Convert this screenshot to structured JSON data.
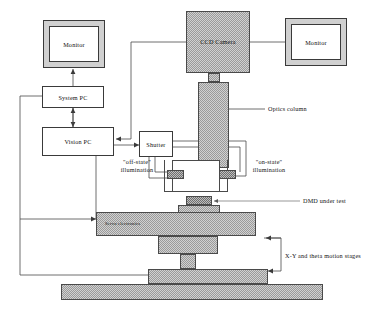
{
  "diagram": {
    "colors": {
      "hatch_fill": "#9a9a9a",
      "hatch_dark": "#6f6f6f",
      "monitor_bezel": "#d0d0d0",
      "line": "#4a4a4a",
      "box_fill": "#ffffff",
      "text": "#111111"
    },
    "nodes": {
      "monitor_left": "Monitor",
      "monitor_right": "Monitor",
      "ccd_camera": "CCD\nCamera",
      "system_pc": "System PC",
      "vision_pc": "Vision PC",
      "shutter": "Shutter",
      "servo_electronics": "Servo electronics"
    },
    "labels": {
      "optics_column": "Optics column",
      "dmd_under_test": "DMD under test",
      "motion_stages": "X-Y and theta motion stages",
      "off_state_line1": "\"off-state\"",
      "off_state_line2": "illumination",
      "on_state_line1": "\"on-state\"",
      "on_state_line2": "illumination"
    }
  }
}
